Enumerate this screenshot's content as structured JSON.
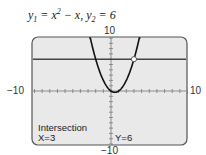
{
  "equation": {
    "y1_name": "y",
    "y1_sub": "1",
    "y1_rhs_a": " = x",
    "y1_exp": "2",
    "y1_rhs_b": " − x,  ",
    "y2_name": "y",
    "y2_sub": "2",
    "y2_rhs": " = 6"
  },
  "window": {
    "xmin": "−10",
    "xmax": "10",
    "ymin": "−10",
    "ymax": "10"
  },
  "screen": {
    "label": "Intersection",
    "x_readout": "X=3",
    "y_readout": "Y=6"
  },
  "chart_data": {
    "type": "line",
    "series": [
      {
        "name": "y1",
        "expr": "x^2 - x"
      },
      {
        "name": "y2",
        "expr": "6"
      }
    ],
    "xlim": [
      -10,
      10
    ],
    "ylim": [
      -10,
      10
    ],
    "xtick_step": 1,
    "ytick_step": 1,
    "annotations": [
      {
        "text": "Intersection",
        "x": 3,
        "y": 6
      }
    ]
  }
}
